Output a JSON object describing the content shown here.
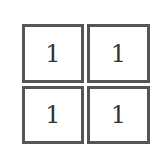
{
  "grid": {
    "rows": 2,
    "cols": 2,
    "cells": [
      {
        "value": "1"
      },
      {
        "value": "1"
      },
      {
        "value": "1"
      },
      {
        "value": "1"
      }
    ],
    "border_color": "#555555"
  }
}
